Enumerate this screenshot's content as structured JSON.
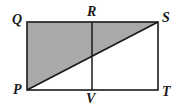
{
  "figure": {
    "type": "geometry-diagram",
    "background_color": "#ffffff",
    "stroke_color": "#1a1a1a",
    "shaded_fill_color": "#a9a9a9",
    "canvas": {
      "width": 178,
      "height": 111
    },
    "rectangle": {
      "name": "rectangle-PQST",
      "left": 27,
      "top": 22,
      "right": 158,
      "bottom": 90,
      "width": 131,
      "height": 68
    },
    "points": [
      {
        "id": "Q",
        "label": "Q",
        "x": 27,
        "y": 22,
        "role": "rectangle-top-left-vertex"
      },
      {
        "id": "R",
        "label": "R",
        "x": 92,
        "y": 22,
        "role": "midpoint-of-top-side"
      },
      {
        "id": "S",
        "label": "S",
        "x": 158,
        "y": 22,
        "role": "rectangle-top-right-vertex"
      },
      {
        "id": "P",
        "label": "P",
        "x": 27,
        "y": 90,
        "role": "rectangle-bottom-left-vertex"
      },
      {
        "id": "V",
        "label": "V",
        "x": 92,
        "y": 90,
        "role": "midpoint-of-bottom-side"
      },
      {
        "id": "T",
        "label": "T",
        "x": 158,
        "y": 90,
        "role": "rectangle-bottom-right-vertex"
      }
    ],
    "segments": [
      {
        "id": "QS",
        "from": "Q",
        "to": "S",
        "role": "rectangle-top-side"
      },
      {
        "id": "ST",
        "from": "S",
        "to": "T",
        "role": "rectangle-right-side"
      },
      {
        "id": "TP",
        "from": "T",
        "to": "P",
        "role": "rectangle-bottom-side"
      },
      {
        "id": "PQ",
        "from": "P",
        "to": "Q",
        "role": "rectangle-left-side"
      },
      {
        "id": "RV",
        "from": "R",
        "to": "V",
        "role": "vertical-midline"
      },
      {
        "id": "PS",
        "from": "P",
        "to": "S",
        "role": "diagonal"
      }
    ],
    "shaded_region": {
      "id": "triangle-PQS",
      "vertices": [
        "P",
        "Q",
        "S"
      ],
      "polygon_points": "27,90 27,22 158,22",
      "description": "Upper-left triangle bounded by PQ, QS and diagonal PS"
    },
    "intersection": {
      "x": 92,
      "y": 56,
      "description": "Diagonal PS crosses midline RV at the center"
    }
  }
}
